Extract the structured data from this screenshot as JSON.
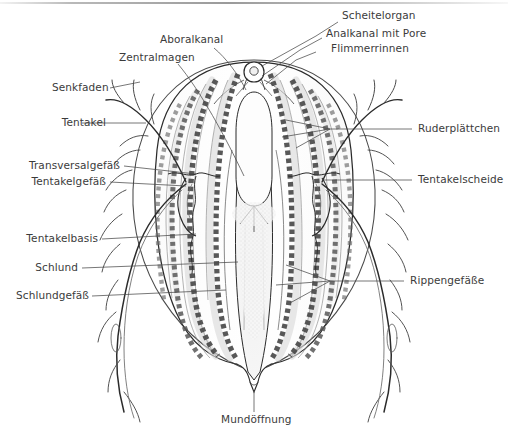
{
  "figure": {
    "title": "",
    "background_color": "#ffffff",
    "ink_color": "#2b2b2b",
    "label_color": "#3b3b3b",
    "leader_color": "#4a4a4a"
  },
  "labels": {
    "aboralkanal": "Aboralkanal",
    "zentralmagen": "Zentralmagen",
    "scheitelorgan": "Scheitelorgan",
    "analkanal_mit_pore": "Analkanal mit Pore",
    "flimmerrinnen": "Flimmerrinnen",
    "senkfaden": "Senkfaden",
    "tentakel": "Tentakel",
    "transversalgefaess": "Transversalgefäß",
    "tentakelgefaess": "Tentakelgefäß",
    "tentakelbasis": "Tentakelbasis",
    "schlund": "Schlund",
    "schlundgefaess": "Schlundgefäß",
    "ruderplaettchen": "Ruderplättchen",
    "tentakelscheide": "Tentakelscheide",
    "rippengefaesse": "Rippengefäße",
    "mundoeffnung": "Mundöffnung"
  }
}
